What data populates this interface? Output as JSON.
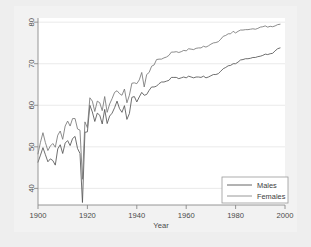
{
  "chart_data": {
    "type": "line",
    "title": "",
    "xlabel": "Year",
    "ylabel": "",
    "xlim": [
      1900,
      2000
    ],
    "ylim": [
      36,
      81
    ],
    "xticks": [
      1900,
      1920,
      1940,
      1960,
      1980,
      2000
    ],
    "yticks": [
      40,
      50,
      60,
      70,
      80
    ],
    "grid": true,
    "grid_axis": "y",
    "legend_position": "bottom-right",
    "legend": [
      "Males",
      "Females"
    ],
    "colors": {
      "males_line": "#555555",
      "females_line": "#777777",
      "axis": "#808080",
      "grid": "#e4e4e4",
      "plot_background": "#ffffff",
      "outer_background": "#f2f2f2",
      "page_background": "#eeeeee",
      "tick_label": "#4a4a4a"
    },
    "x": [
      1900,
      1901,
      1902,
      1903,
      1904,
      1905,
      1906,
      1907,
      1908,
      1909,
      1910,
      1911,
      1912,
      1913,
      1914,
      1915,
      1916,
      1917,
      1918,
      1919,
      1920,
      1921,
      1922,
      1923,
      1924,
      1925,
      1926,
      1927,
      1928,
      1929,
      1930,
      1931,
      1932,
      1933,
      1934,
      1935,
      1936,
      1937,
      1938,
      1939,
      1940,
      1941,
      1942,
      1943,
      1944,
      1945,
      1946,
      1947,
      1948,
      1949,
      1950,
      1951,
      1952,
      1953,
      1954,
      1955,
      1956,
      1957,
      1958,
      1959,
      1960,
      1961,
      1962,
      1963,
      1964,
      1965,
      1966,
      1967,
      1968,
      1969,
      1970,
      1971,
      1972,
      1973,
      1974,
      1975,
      1976,
      1977,
      1978,
      1979,
      1980,
      1981,
      1982,
      1983,
      1984,
      1985,
      1986,
      1987,
      1988,
      1989,
      1990,
      1991,
      1992,
      1993,
      1994,
      1995,
      1996,
      1997,
      1998
    ],
    "series": [
      {
        "name": "Males",
        "values": [
          46.3,
          48.0,
          49.8,
          48.1,
          46.4,
          47.1,
          46.7,
          45.6,
          49.5,
          50.5,
          48.4,
          50.9,
          51.5,
          50.3,
          52.0,
          52.5,
          49.6,
          48.4,
          36.6,
          53.5,
          53.6,
          60.0,
          58.4,
          56.1,
          58.1,
          57.6,
          55.5,
          59.0,
          55.6,
          57.4,
          58.1,
          59.4,
          61.0,
          59.2,
          58.3,
          59.9,
          56.6,
          58.0,
          61.9,
          62.1,
          60.8,
          62.0,
          63.1,
          62.4,
          62.6,
          63.6,
          64.4,
          64.4,
          64.6,
          65.2,
          65.6,
          65.6,
          65.8,
          66.0,
          66.7,
          66.7,
          66.7,
          66.4,
          66.6,
          66.8,
          66.6,
          67.0,
          66.8,
          66.6,
          66.8,
          66.8,
          66.7,
          67.0,
          66.6,
          66.8,
          67.1,
          67.4,
          67.4,
          67.6,
          68.2,
          68.8,
          69.1,
          69.5,
          69.6,
          70.0,
          70.0,
          70.4,
          70.9,
          71.0,
          71.2,
          71.2,
          71.3,
          71.5,
          71.5,
          71.7,
          71.8,
          72.0,
          72.3,
          72.2,
          72.4,
          72.5,
          73.1,
          73.6,
          73.8
        ]
      },
      {
        "name": "Females",
        "values": [
          48.3,
          51.1,
          53.4,
          51.0,
          49.1,
          50.2,
          50.8,
          49.9,
          52.8,
          53.8,
          51.8,
          55.0,
          56.2,
          55.0,
          56.8,
          56.8,
          54.3,
          54.0,
          42.2,
          56.0,
          54.6,
          61.8,
          61.0,
          58.5,
          61.0,
          60.6,
          58.7,
          62.1,
          58.3,
          60.3,
          61.6,
          63.1,
          63.5,
          62.8,
          62.4,
          63.9,
          60.6,
          62.4,
          65.3,
          65.4,
          65.2,
          66.1,
          67.9,
          64.4,
          67.4,
          67.9,
          69.4,
          69.7,
          71.0,
          71.1,
          71.1,
          71.4,
          71.6,
          72.0,
          72.8,
          72.8,
          72.9,
          72.7,
          72.9,
          73.2,
          73.1,
          73.6,
          73.5,
          73.4,
          73.7,
          73.8,
          73.8,
          74.2,
          74.0,
          74.3,
          74.7,
          75.0,
          75.1,
          75.3,
          75.9,
          76.6,
          76.8,
          77.2,
          77.2,
          77.8,
          77.4,
          77.8,
          78.1,
          78.1,
          78.2,
          78.2,
          78.3,
          78.4,
          78.3,
          78.5,
          78.8,
          78.9,
          79.1,
          78.8,
          79.0,
          78.9,
          79.1,
          79.4,
          79.5
        ]
      }
    ]
  },
  "axis": {
    "x_title": "Year",
    "x_tick_labels": [
      "1900",
      "1920",
      "1940",
      "1960",
      "1980",
      "2000"
    ],
    "y_tick_labels": [
      "40",
      "50",
      "60",
      "70",
      "80"
    ]
  },
  "legend": {
    "items": [
      {
        "label": "Males"
      },
      {
        "label": "Females"
      }
    ]
  }
}
